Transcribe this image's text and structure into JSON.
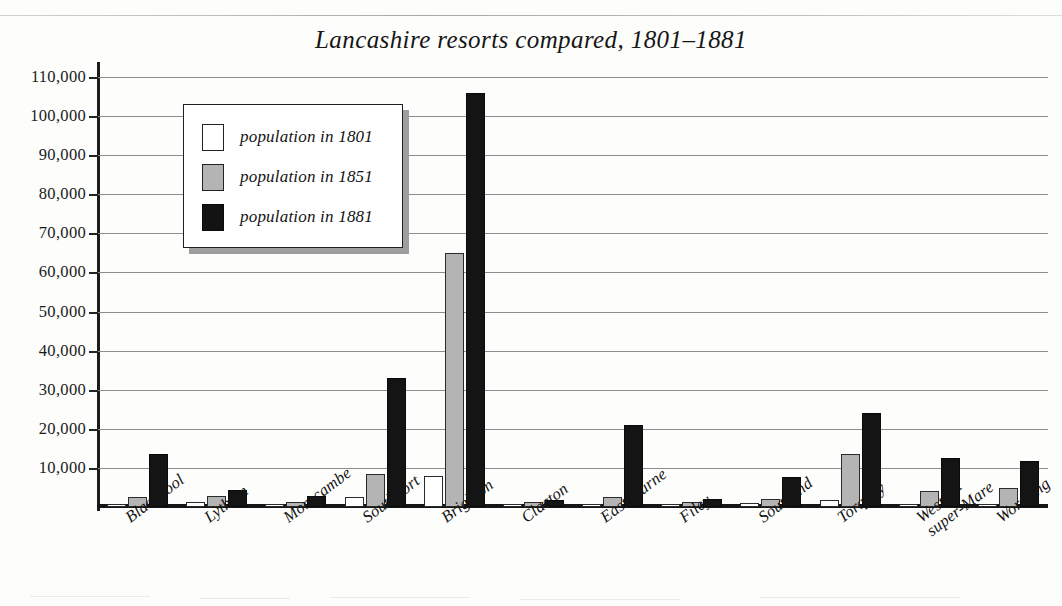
{
  "title": "Lancashire resorts compared, 1801–1881",
  "legend": {
    "items": [
      {
        "label": "population in 1801",
        "swatch": "white-swatch",
        "color": "#ffffff"
      },
      {
        "label": "population in 1851",
        "swatch": "grey-swatch",
        "color": "#b4b4b4"
      },
      {
        "label": "population in 1881",
        "swatch": "black-swatch",
        "color": "#141414"
      }
    ]
  },
  "axes": {
    "y_ticks": [
      "0",
      "10,000",
      "20,000",
      "30,000",
      "40,000",
      "50,000",
      "60,000",
      "70,000",
      "80,000",
      "90,000",
      "100,000",
      "110,000"
    ],
    "y_min": 0,
    "y_max": 110000,
    "y_step": 10000,
    "gridlines": true
  },
  "chart_data": {
    "type": "bar",
    "title": "Lancashire resorts compared, 1801–1881",
    "xlabel": "",
    "ylabel": "",
    "ylim": [
      0,
      110000
    ],
    "ytick_step": 10000,
    "grid": true,
    "legend_position": "upper-left-inside",
    "categories": [
      "Blackpool",
      "Lytham",
      "Morecambe",
      "Southport",
      "Brighton",
      "Clacton",
      "Eastbourne",
      "Filey",
      "Southend",
      "Torquay",
      "Weston-\nsuper-Mare",
      "Worthing"
    ],
    "series": [
      {
        "name": "population in 1801",
        "color": "#ffffff",
        "values": [
          500,
          1300,
          600,
          2500,
          8000,
          600,
          700,
          500,
          1000,
          1800,
          400,
          500
        ]
      },
      {
        "name": "population in 1851",
        "color": "#b4b4b4",
        "values": [
          2500,
          2700,
          1300,
          8500,
          65000,
          1200,
          2500,
          1200,
          2000,
          13500,
          4200,
          4800
        ]
      },
      {
        "name": "population in 1881",
        "color": "#141414",
        "values": [
          13500,
          4300,
          2800,
          33000,
          106000,
          1800,
          21000,
          2000,
          7700,
          24000,
          12500,
          11700
        ]
      }
    ]
  }
}
